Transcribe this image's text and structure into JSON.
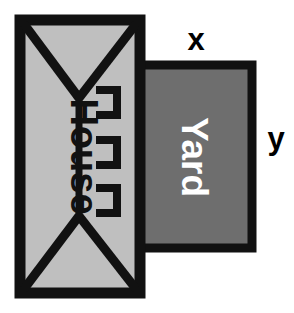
{
  "diagram": {
    "shapes": {
      "house": {
        "label": "House",
        "fill_color": "#bfbfbf",
        "stroke_color": "#000000",
        "label_color": "#000000",
        "label_orientation": "vertical",
        "x": 20,
        "y": 20,
        "width": 120,
        "height": 273
      },
      "yard": {
        "label": "Yard",
        "fill_color": "#6e6e6e",
        "stroke_color": "#000000",
        "label_color": "#ffffff",
        "label_orientation": "vertical",
        "x": 136,
        "y": 65,
        "width": 116,
        "height": 183
      }
    },
    "dimension_labels": [
      {
        "name": "width-label",
        "text": "x",
        "color": "#000000"
      },
      {
        "name": "height-label",
        "text": "y",
        "color": "#000000"
      }
    ],
    "house_features": {
      "roof_lines": "hip-roof diagonals at top and bottom",
      "center_line": "vertical divider",
      "window_count": 3,
      "window_glyph": "bracket-open-left"
    }
  }
}
